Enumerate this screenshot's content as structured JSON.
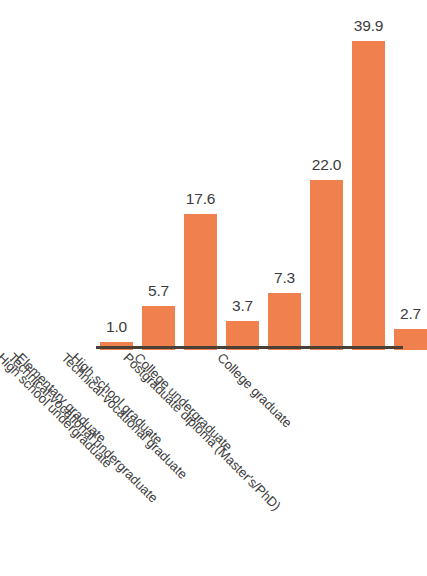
{
  "chart_data": {
    "type": "bar",
    "title": "",
    "subtitle": "",
    "xlabel": "",
    "ylabel": "",
    "ylim": [
      0,
      42
    ],
    "grid": false,
    "legend": "none",
    "bar_color": "#f0814f",
    "axis_color": "#4a4036",
    "label_color": "#3c3c3c",
    "label_rotation_deg": 45,
    "categories": [
      "Elementary graduate",
      "High school undergraduate",
      "High school graduate",
      "Technical-vocational undergraduate",
      "Technical-vocational graduate",
      "College undergraduate",
      "College graduate",
      "Postgraduate diploma (Master's/PhD)"
    ],
    "values": [
      1.0,
      5.7,
      17.6,
      3.7,
      7.3,
      22.0,
      39.9,
      2.7
    ],
    "value_labels": [
      "1.0",
      "5.7",
      "17.6",
      "3.7",
      "7.3",
      "22.0",
      "39.9",
      "2.7"
    ]
  }
}
